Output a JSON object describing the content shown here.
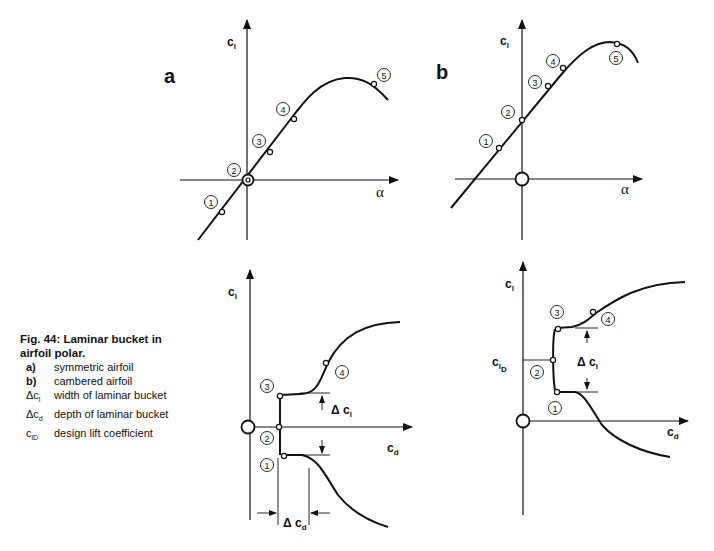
{
  "figure": {
    "panel_labels": [
      "a",
      "b"
    ],
    "axis_labels": {
      "cl": "c l",
      "alpha": "α",
      "cd": "c d",
      "delta_cl": "Δ c l",
      "delta_cd": "Δ c d",
      "cl_design": "c lD"
    },
    "point_labels": [
      "1",
      "2",
      "3",
      "4",
      "5"
    ]
  },
  "caption": {
    "title_line1": "Fig. 44: Laminar bucket in",
    "title_line2": "airfoil polar.",
    "items": [
      {
        "key": "a)",
        "text": "symmetric airfoil"
      },
      {
        "key": "b)",
        "text": "cambered airfoil"
      },
      {
        "key": "Δc",
        "sub": "l",
        "text": "width of laminar bucket"
      },
      {
        "key": "Δc",
        "sub": "d",
        "text": "depth of laminar bucket"
      },
      {
        "key": "c",
        "sub": "lD",
        "text": "design lift coefficient"
      }
    ]
  }
}
